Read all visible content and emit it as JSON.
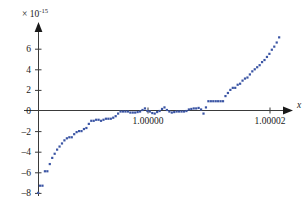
{
  "figure": {
    "name": "floating-point-cancellation-scatter",
    "background": "#ffffff",
    "point_color": "#3b55a4",
    "axis_color": "#3a3a3a",
    "width": 306,
    "height": 207
  },
  "axes": {
    "y_exponent_label": {
      "multiplier": "× 10",
      "exponent": "-15",
      "full": "× 10⁻¹⁵"
    },
    "x_axis_label": "x",
    "y_ticks": [
      {
        "value": 6,
        "label": "6"
      },
      {
        "value": 4,
        "label": "4"
      },
      {
        "value": 2,
        "label": "2"
      },
      {
        "value": 0,
        "label": "0"
      },
      {
        "value": -2,
        "label": "–2"
      },
      {
        "value": -4,
        "label": "–4"
      },
      {
        "value": -6,
        "label": "–6"
      },
      {
        "value": -8,
        "label": "–8"
      }
    ],
    "x_ticks": [
      {
        "value": 1.0,
        "label": "1.00000"
      },
      {
        "value": 1.00002,
        "label": "1.00002"
      }
    ]
  },
  "chart_data": {
    "type": "scatter",
    "title": "",
    "subtitle": "",
    "xlabel": "x",
    "ylabel": "",
    "y_scale_factor": 1e-15,
    "y_scale_text": "× 10⁻¹⁵",
    "xlim": [
      0.999982,
      1.0000235
    ],
    "ylim": [
      -8.4,
      7.6
    ],
    "xticks": [
      1.0,
      1.00002
    ],
    "xticklabels": [
      "1.00000",
      "1.00002"
    ],
    "yticks": [
      -8,
      -6,
      -4,
      -2,
      0,
      2,
      4,
      6
    ],
    "yticklabels": [
      "–8",
      "–6",
      "–4",
      "–2",
      "0",
      "2",
      "4",
      "6"
    ],
    "grid": false,
    "legend": null,
    "marker": "square",
    "marker_size_px": 2.2,
    "series": [
      {
        "name": "cancellation error",
        "color": "#3b55a4",
        "comment": "y values are in units of 1e-15; x values are absolute",
        "x": [
          0.999982,
          0.9999823,
          0.9999827,
          0.9999831,
          0.9999835,
          0.9999839,
          0.9999843,
          0.9999847,
          0.9999851,
          0.9999855,
          0.9999859,
          0.9999863,
          0.9999867,
          0.9999871,
          0.9999875,
          0.9999879,
          0.9999883,
          0.9999887,
          0.9999891,
          0.9999895,
          0.9999899,
          0.9999903,
          0.9999907,
          0.9999911,
          0.9999915,
          0.9999919,
          0.9999923,
          0.9999927,
          0.9999931,
          0.9999935,
          0.9999939,
          0.9999943,
          0.9999947,
          0.9999951,
          0.9999955,
          0.9999959,
          0.9999963,
          0.9999967,
          0.9999971,
          0.9999975,
          0.9999979,
          0.9999983,
          0.9999987,
          0.9999991,
          0.9999995,
          0.9999999,
          1.0000003,
          1.0000007,
          1.0000011,
          1.0000015,
          1.0000019,
          1.0000023,
          1.0000027,
          1.0000031,
          1.0000035,
          1.0000039,
          1.0000043,
          1.0000047,
          1.0000051,
          1.0000055,
          1.0000059,
          1.0000063,
          1.0000067,
          1.0000071,
          1.0000075,
          1.0000079,
          1.0000083,
          1.0000087,
          1.0000091,
          1.0000095,
          1.0000099,
          1.0000103,
          1.0000107,
          1.0000111,
          1.0000115,
          1.0000119,
          1.0000123,
          1.0000127,
          1.0000131,
          1.0000135,
          1.0000139,
          1.0000143,
          1.0000147,
          1.0000151,
          1.0000155,
          1.0000159,
          1.0000163,
          1.0000167,
          1.0000171,
          1.0000175,
          1.0000179,
          1.0000183,
          1.0000187,
          1.0000191,
          1.0000195,
          1.0000199,
          1.0000203,
          1.0000207,
          1.0000211,
          1.0000215
        ],
        "y": [
          -8.0,
          -7.3,
          -7.3,
          -5.9,
          -5.9,
          -5.2,
          -4.6,
          -4.2,
          -3.8,
          -3.5,
          -3.2,
          -2.9,
          -2.7,
          -2.6,
          -2.6,
          -2.3,
          -2.1,
          -2.0,
          -2.0,
          -1.8,
          -1.7,
          -1.3,
          -1.0,
          -1.0,
          -0.9,
          -0.9,
          -1.0,
          -0.9,
          -0.8,
          -0.8,
          -0.8,
          -0.7,
          -0.55,
          -0.3,
          -0.1,
          -0.1,
          -0.1,
          -0.1,
          -0.2,
          -0.2,
          -0.2,
          -0.15,
          -0.1,
          0.05,
          0.2,
          -0.05,
          -0.1,
          -0.25,
          -0.3,
          -0.15,
          -0.05,
          0.15,
          0.3,
          0.05,
          -0.1,
          -0.2,
          -0.15,
          -0.1,
          -0.1,
          -0.1,
          -0.1,
          -0.05,
          0.1,
          0.15,
          0.2,
          0.2,
          0.25,
          0.1,
          -0.3,
          0.3,
          0.9,
          0.9,
          0.9,
          0.9,
          0.9,
          0.9,
          0.9,
          1.4,
          1.7,
          2.0,
          2.2,
          2.2,
          2.5,
          2.6,
          2.9,
          3.1,
          3.2,
          3.5,
          3.8,
          4.0,
          4.2,
          4.4,
          4.7,
          4.9,
          5.2,
          5.5,
          5.9,
          6.2,
          6.6,
          7.1
        ]
      }
    ]
  }
}
